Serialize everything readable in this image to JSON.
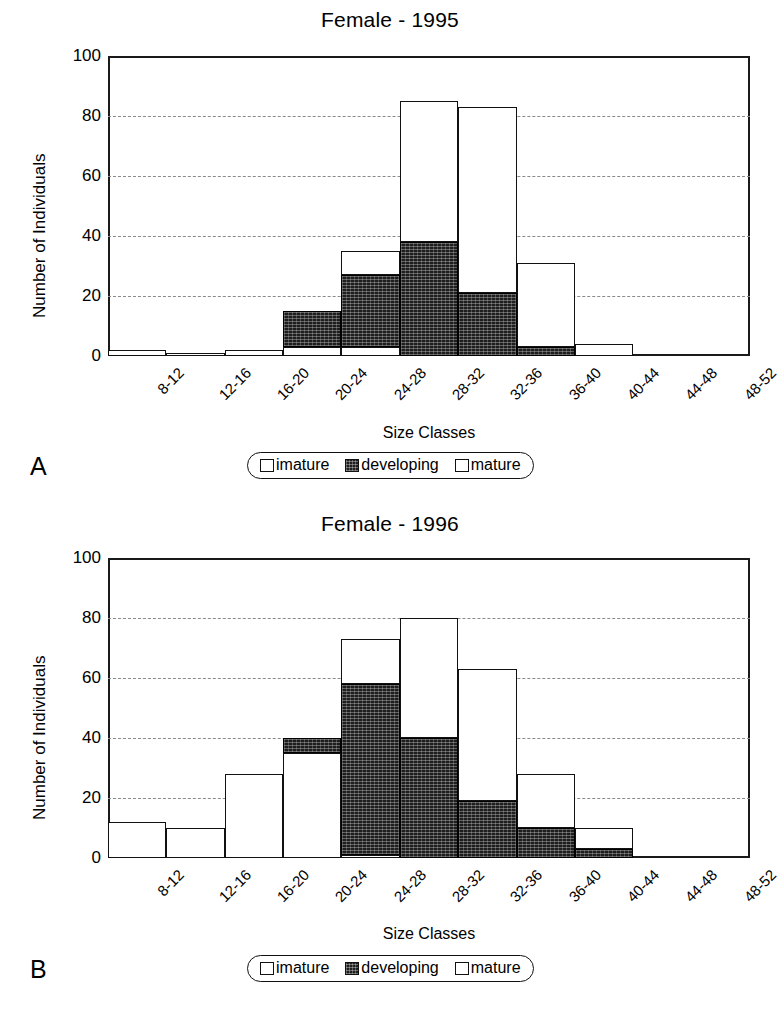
{
  "figure": {
    "panel_a_letter": "A",
    "panel_b_letter": "B"
  },
  "legend": {
    "items": [
      {
        "label": "imature",
        "swatch": "white-square-icon"
      },
      {
        "label": "developing",
        "swatch": "hatched-square-icon"
      },
      {
        "label": "mature",
        "swatch": "white-square-icon"
      }
    ]
  },
  "chart_data": [
    {
      "type": "bar",
      "id": "female-1995",
      "panel": "A",
      "title": "Female - 1995",
      "xlabel": "Size Classes",
      "ylabel": "Number of Individuals",
      "ylim": [
        0,
        100
      ],
      "yticks": [
        0,
        20,
        40,
        60,
        80,
        100
      ],
      "grid": true,
      "stacked": true,
      "legend_position": "below",
      "categories": [
        "8-12",
        "12-16",
        "16-20",
        "20-24",
        "24-28",
        "28-32",
        "32-36",
        "36-40",
        "40-44",
        "44-48",
        "48-52"
      ],
      "series": [
        {
          "name": "imature",
          "values": [
            2,
            1,
            2,
            3,
            3,
            0,
            0,
            0,
            0,
            0,
            0
          ]
        },
        {
          "name": "developing",
          "values": [
            0,
            0,
            0,
            12,
            24,
            38,
            21,
            3,
            0,
            0,
            0
          ]
        },
        {
          "name": "mature",
          "values": [
            0,
            0,
            0,
            0,
            8,
            47,
            62,
            28,
            4,
            0,
            0
          ]
        }
      ],
      "totals": [
        2,
        1,
        2,
        15,
        35,
        85,
        83,
        31,
        4,
        0,
        0
      ]
    },
    {
      "type": "bar",
      "id": "female-1996",
      "panel": "B",
      "title": "Female - 1996",
      "xlabel": "Size Classes",
      "ylabel": "Number of Individuals",
      "ylim": [
        0,
        100
      ],
      "yticks": [
        0,
        20,
        40,
        60,
        80,
        100
      ],
      "grid": true,
      "stacked": true,
      "legend_position": "below",
      "categories": [
        "8-12",
        "12-16",
        "16-20",
        "20-24",
        "24-28",
        "28-32",
        "32-36",
        "36-40",
        "40-44",
        "44-48",
        "48-52"
      ],
      "series": [
        {
          "name": "imature",
          "values": [
            12,
            10,
            28,
            35,
            1,
            0,
            0,
            0,
            0,
            0,
            0
          ]
        },
        {
          "name": "developing",
          "values": [
            0,
            0,
            0,
            5,
            57,
            40,
            19,
            10,
            3,
            0,
            0
          ]
        },
        {
          "name": "mature",
          "values": [
            0,
            0,
            0,
            0,
            15,
            40,
            44,
            18,
            7,
            0,
            0
          ]
        }
      ],
      "totals": [
        12,
        10,
        28,
        40,
        73,
        80,
        63,
        28,
        10,
        0,
        0
      ]
    }
  ]
}
